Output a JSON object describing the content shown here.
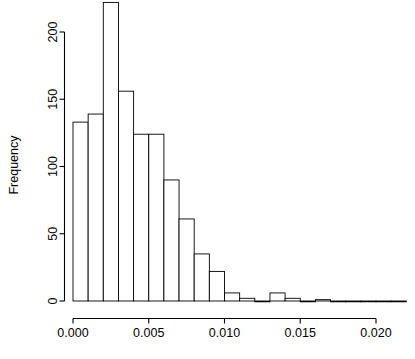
{
  "chart_data": {
    "type": "bar",
    "title": "",
    "subtitle": "",
    "xlabel": "",
    "ylabel": "Frequency",
    "grid": false,
    "legend": false,
    "bin_width": 0.001,
    "bin_starts": [
      0.0,
      0.001,
      0.002,
      0.003,
      0.004,
      0.005,
      0.006,
      0.007,
      0.008,
      0.009,
      0.01,
      0.011,
      0.012,
      0.013,
      0.014,
      0.015,
      0.016,
      0.017,
      0.018,
      0.019,
      0.02,
      0.021
    ],
    "categories": [
      "0.000-0.001",
      "0.001-0.002",
      "0.002-0.003",
      "0.003-0.004",
      "0.004-0.005",
      "0.005-0.006",
      "0.006-0.007",
      "0.007-0.008",
      "0.008-0.009",
      "0.009-0.010",
      "0.010-0.011",
      "0.011-0.012",
      "0.012-0.013",
      "0.013-0.014",
      "0.014-0.015",
      "0.015-0.016",
      "0.016-0.017",
      "0.017-0.018",
      "0.018-0.019",
      "0.019-0.020",
      "0.020-0.021",
      "0.021-0.022"
    ],
    "values": [
      133,
      139,
      222,
      156,
      124,
      124,
      90,
      61,
      35,
      22,
      6,
      2,
      0,
      6,
      2,
      0,
      1,
      0,
      0,
      0,
      0,
      0
    ],
    "xlim": [
      0.0,
      0.022
    ],
    "ylim": [
      0,
      222
    ],
    "x_ticks": [
      0.0,
      0.005,
      0.01,
      0.015,
      0.02
    ],
    "x_tick_labels": [
      "0.000",
      "0.005",
      "0.010",
      "0.015",
      "0.020"
    ],
    "y_ticks": [
      0,
      50,
      100,
      150,
      200
    ],
    "y_tick_labels": [
      "0",
      "50",
      "100",
      "150",
      "200"
    ],
    "bar_fill": "#ffffff",
    "bar_stroke": "#000000",
    "axis_color": "#000000",
    "background": "#ffffff"
  }
}
